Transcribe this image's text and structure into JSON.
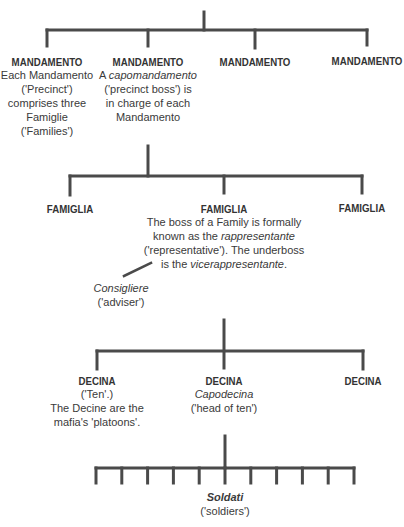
{
  "diagram": {
    "type": "organisational-hierarchy",
    "top_label": "",
    "mandamenti": [
      {
        "title": "MANDAMENTO",
        "lines": [
          "Each Mandamento",
          "('Precinct')",
          "comprises three",
          "Famiglie",
          "('Families')"
        ]
      },
      {
        "title": "MANDAMENTO",
        "lines_rich": [
          [
            {
              "t": "A "
            },
            {
              "t": "capomandamento",
              "i": true
            }
          ],
          [
            {
              "t": "('precinct boss') is"
            }
          ],
          [
            {
              "t": "in charge of each"
            }
          ],
          [
            {
              "t": "Mandamento"
            }
          ]
        ]
      },
      {
        "title": "MANDAMENTO"
      },
      {
        "title": "MANDAMENTO"
      }
    ],
    "famiglie": [
      {
        "title": "FAMIGLIA"
      },
      {
        "title": "FAMIGLIA",
        "lines_rich": [
          [
            {
              "t": "The boss of a Family is formally"
            }
          ],
          [
            {
              "t": "known as the "
            },
            {
              "t": "rappresentante",
              "i": true
            }
          ],
          [
            {
              "t": "('representative'). The underboss"
            }
          ],
          [
            {
              "t": "is the "
            },
            {
              "t": "vicerappresentante",
              "i": true
            },
            {
              "t": "."
            }
          ]
        ]
      },
      {
        "title": "FAMIGLIA"
      }
    ],
    "consigliere": {
      "title": "Consigliere",
      "translation": "('adviser')"
    },
    "decine": [
      {
        "title": "DECINA",
        "lines": [
          "('Ten'.)",
          "The Decine are the",
          "mafia's 'platoons'."
        ]
      },
      {
        "title": "DECINA",
        "lines_rich": [
          [
            {
              "t": "Capodecina",
              "i": true
            }
          ],
          [
            {
              "t": "('head of ten')"
            }
          ]
        ]
      },
      {
        "title": "DECINA"
      }
    ],
    "soldati": {
      "title": "Soldati",
      "translation": "('soldiers')",
      "count": 11
    }
  }
}
